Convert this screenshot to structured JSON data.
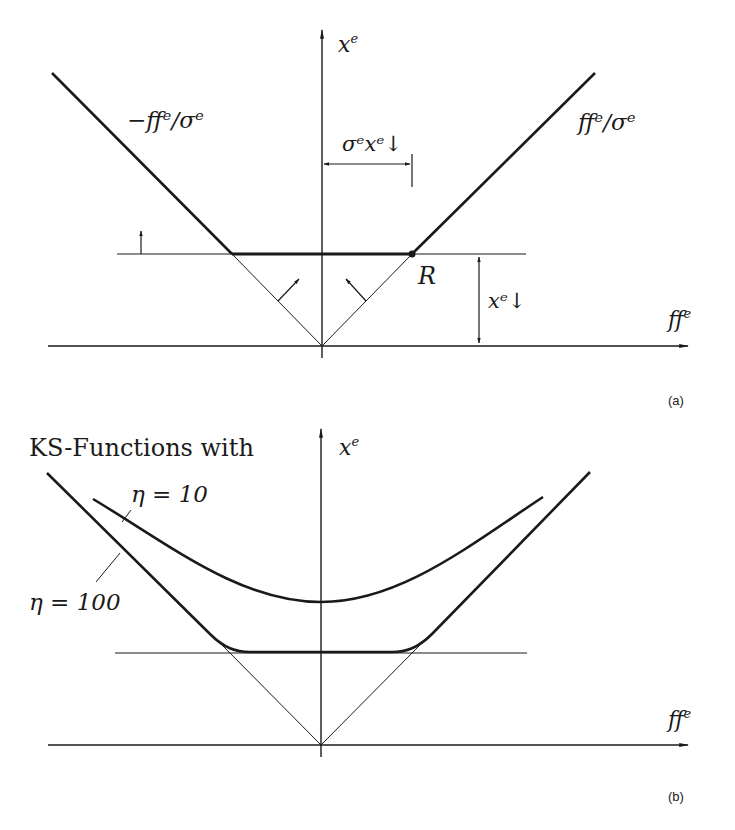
{
  "panel_a": {
    "caption": "(a)",
    "y_axis_label": "x",
    "y_axis_sup": "e",
    "x_axis_label": "ff",
    "x_axis_sup": "e",
    "left_line_label": "−ffᵉ/σᵉ",
    "right_line_label": "ffᵉ/σᵉ",
    "width_dim_label": "σᵉxᵉ↓",
    "height_dim_label": "xᵉ↓",
    "point_label": "R"
  },
  "panel_b": {
    "caption": "(b)",
    "title": "KS-Functions with",
    "y_axis_label": "x",
    "y_axis_sup": "e",
    "x_axis_label": "ff",
    "x_axis_sup": "e",
    "curve_1_label": "η = 10",
    "curve_2_label": "η = 100"
  },
  "colors": {
    "ink": "#1a1a1a",
    "background": "#ffffff"
  }
}
